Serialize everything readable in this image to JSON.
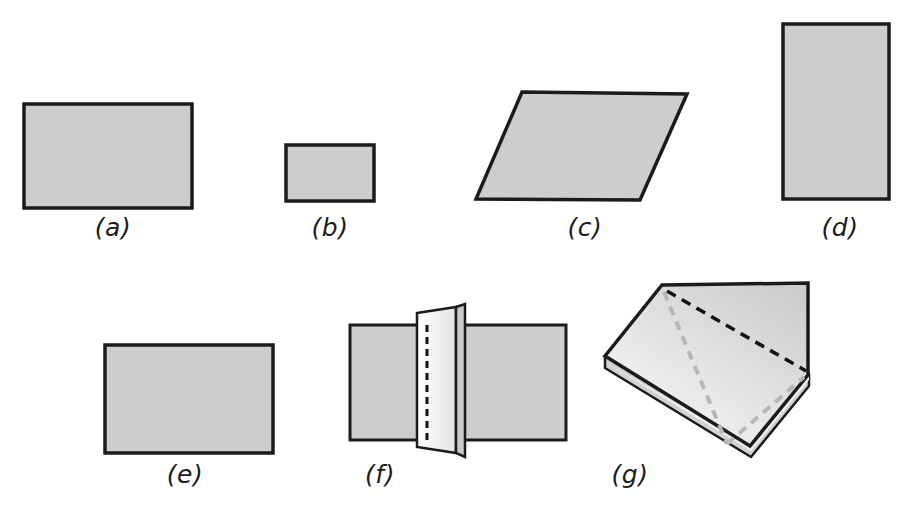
{
  "figure": {
    "caption_style": "parenthesized italic letters",
    "background_color": "#ffffff",
    "fill_color": "#cdcdcd",
    "stroke_color": "#1b1b1b",
    "fold_line_color": "#111111",
    "secondary_fold_line_color": "#b4b4b4",
    "edge_highlight_color": "#f4f4f4"
  },
  "panels": [
    {
      "id": "a",
      "label": "(a)",
      "shape": "rectangle",
      "description": "large horizontal rectangle, flat sheet",
      "label_x": 113,
      "label_y": 213,
      "geometry": {
        "x": 24,
        "y": 104,
        "width": 168,
        "height": 104
      }
    },
    {
      "id": "b",
      "label": "(b)",
      "shape": "rectangle",
      "description": "small horizontal rectangle, flat sheet",
      "label_x": 330,
      "label_y": 213,
      "geometry": {
        "x": 286,
        "y": 145,
        "width": 88,
        "height": 56
      }
    },
    {
      "id": "c",
      "label": "(c)",
      "shape": "parallelogram",
      "description": "slanted parallelogram, sheet seen in perspective",
      "label_x": 585,
      "label_y": 213,
      "geometry": {
        "points": "522,92 687,94 640,200 476,199"
      }
    },
    {
      "id": "d",
      "label": "(d)",
      "shape": "rectangle",
      "description": "tall vertical rectangle, flat sheet",
      "label_x": 840,
      "label_y": 213,
      "geometry": {
        "x": 783,
        "y": 24,
        "width": 106,
        "height": 175
      }
    },
    {
      "id": "e",
      "label": "(e)",
      "shape": "rectangle",
      "description": "medium horizontal rectangle, flat sheet",
      "label_x": 185,
      "label_y": 460,
      "geometry": {
        "x": 105,
        "y": 345,
        "width": 168,
        "height": 108
      }
    },
    {
      "id": "f",
      "label": "(f)",
      "shape": "folded-sheet-vertical-crease",
      "description": "rectangle folded along a vertical dashed crease with a raised flap standing up",
      "label_x": 380,
      "label_y": 460,
      "geometry": {
        "left_panel": "350,325 455,325 455,440 350,440",
        "right_panel": "455,325 566,325 566,440 455,440",
        "flap_front": "418,313 458,308 458,452 418,448",
        "flap_edge": "455,312 464,306 464,456 455,450",
        "crease_dashed": "427,325 427,440"
      }
    },
    {
      "id": "g",
      "label": "(g)",
      "shape": "folded-sheet-diagonal-creases",
      "description": "thick sheet folded diagonally, shown in oblique 3D view with two dashed diagonal fold lines",
      "label_x": 630,
      "label_y": 460,
      "geometry": {
        "top_face": "662,285 808,283 808,375 750,446 605,357",
        "thickness_left": "605,357 605,367 750,456 750,446",
        "thickness_right": "750,446 750,456 808,385 808,375",
        "fold_dark": "666,290 808,372",
        "fold_light_1": "664,292 726,444",
        "fold_light_2": "726,444 805,378"
      }
    }
  ]
}
